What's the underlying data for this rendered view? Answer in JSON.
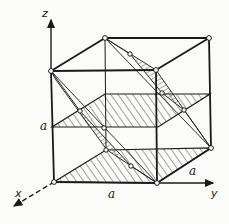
{
  "figure": {
    "axes": {
      "z_label": "z",
      "y_label": "y",
      "x_label": "x"
    },
    "edge_labels": {
      "vertical": "a",
      "bottom_front": "a",
      "bottom_side": "a"
    },
    "colors": {
      "line": "#1a1a1a",
      "background": "#fbfbfa",
      "hatch": "#333333"
    }
  }
}
